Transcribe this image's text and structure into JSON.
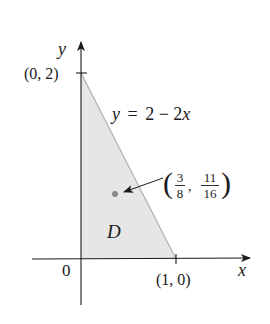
{
  "figure": {
    "axes": {
      "x_label": "x",
      "y_label": "y",
      "origin_label": "0"
    },
    "points": {
      "y_intercept": "(0, 2)",
      "x_intercept": "(1, 0)"
    },
    "line": {
      "equation_lhs": "y",
      "equation_eq": "=",
      "equation_rhs": "2 − 2x",
      "equation_full": "y = 2 − 2x"
    },
    "region": {
      "label": "D",
      "fill_color": "#e6e6e6",
      "edge_color": "#b3b3b3"
    },
    "centroid": {
      "x_num": "3",
      "x_den": "8",
      "y_num": "11",
      "y_den": "16",
      "dot_color": "#8a8a8a"
    }
  }
}
